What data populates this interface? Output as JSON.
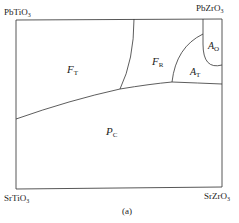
{
  "diagram": {
    "corners": {
      "top_left": {
        "base": "PbTiO",
        "sub": "3"
      },
      "top_right": {
        "base": "PbZrO",
        "sub": "3"
      },
      "bottom_left": {
        "base": "SrTiO",
        "sub": "3"
      },
      "bottom_right": {
        "base": "SrZrO",
        "sub": "3"
      }
    },
    "phases": [
      {
        "id": "FT",
        "base": "F",
        "sub": "T"
      },
      {
        "id": "FR",
        "base": "F",
        "sub": "R"
      },
      {
        "id": "AO",
        "base": "A",
        "sub": "O"
      },
      {
        "id": "AT",
        "base": "A",
        "sub": "T"
      },
      {
        "id": "PC",
        "base": "P",
        "sub": "C"
      }
    ],
    "caption": "(a)",
    "line_color": "#333333"
  }
}
